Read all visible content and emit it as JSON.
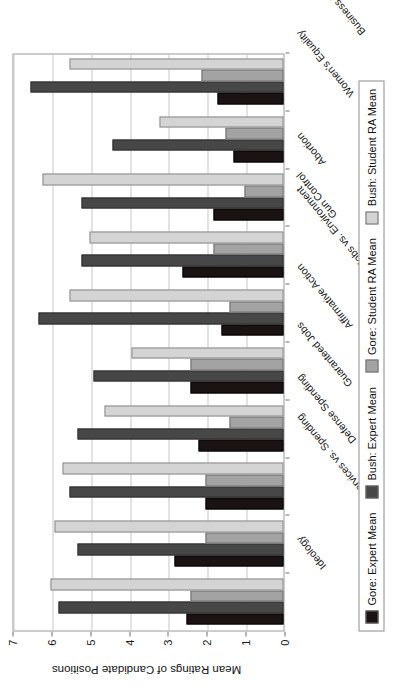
{
  "chart_data": {
    "type": "bar",
    "orientation": "vertical-rotated",
    "title": "",
    "xlabel": "",
    "ylabel": "Mean Ratings of Candidate Positions",
    "ylim": [
      0,
      7
    ],
    "ytick_labels": [
      "0",
      "1",
      "2",
      "3",
      "4",
      "5",
      "6",
      "7"
    ],
    "ytick_values": [
      0,
      1,
      2,
      3,
      4,
      5,
      6,
      7
    ],
    "grid": true,
    "legend_position": "bottom",
    "categories": [
      "Ideology",
      "Services vs. Spending",
      "Defense Spending",
      "Guaranteed Jobs",
      "Affirmative Action",
      "Jobs vs. Environment",
      "Gun Control",
      "Abortion",
      "Women's Equality",
      "Business Regulations"
    ],
    "series": [
      {
        "name": "Gore: Expert Mean",
        "color": "#1b1213",
        "values": [
          2.5,
          2.8,
          2.0,
          2.2,
          2.4,
          1.6,
          2.6,
          1.8,
          1.3,
          1.7
        ]
      },
      {
        "name": "Bush: Expert Mean",
        "color": "#474747",
        "values": [
          5.8,
          5.3,
          5.5,
          5.3,
          4.9,
          6.3,
          5.2,
          5.2,
          4.4,
          6.5
        ]
      },
      {
        "name": "Gore: Student RA Mean",
        "color": "#a3a3a3",
        "values": [
          2.4,
          2.0,
          2.0,
          1.4,
          2.4,
          1.4,
          1.8,
          1.0,
          1.5,
          2.1
        ]
      },
      {
        "name": "Bush: Student RA Mean",
        "color": "#d4d4d4",
        "values": [
          6.0,
          5.9,
          5.7,
          4.6,
          3.9,
          5.5,
          5.0,
          6.2,
          3.2,
          5.5
        ]
      }
    ]
  },
  "legend": {
    "entries": [
      {
        "label": "Gore: Expert Mean",
        "color": "#1b1213"
      },
      {
        "label": "Bush: Expert Mean",
        "color": "#474747"
      },
      {
        "label": "Gore: Student RA Mean",
        "color": "#a3a3a3"
      },
      {
        "label": "Bush: Student RA Mean",
        "color": "#d4d4d4"
      }
    ]
  }
}
